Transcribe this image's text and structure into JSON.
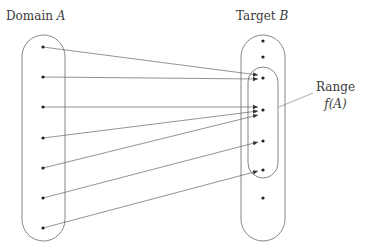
{
  "title_domain": {
    "text": "Domain",
    "var": "A"
  },
  "title_target": {
    "text": "Target",
    "var": "B"
  },
  "range_label": {
    "line1": "Range",
    "line2": "f(A)"
  },
  "colors": {
    "stroke": "#555555",
    "dot": "#222222",
    "background": "#ffffff"
  },
  "domain_points": [
    {
      "id": "a1",
      "x": 43,
      "y": 47
    },
    {
      "id": "a2",
      "x": 43,
      "y": 77
    },
    {
      "id": "a3",
      "x": 43,
      "y": 107
    },
    {
      "id": "a4",
      "x": 43,
      "y": 138
    },
    {
      "id": "a5",
      "x": 43,
      "y": 168
    },
    {
      "id": "a6",
      "x": 43,
      "y": 198
    },
    {
      "id": "a7",
      "x": 43,
      "y": 228
    }
  ],
  "target_points": [
    {
      "id": "b1",
      "x": 263,
      "y": 41,
      "in_range": false
    },
    {
      "id": "b2",
      "x": 263,
      "y": 57,
      "in_range": false
    },
    {
      "id": "b3",
      "x": 263,
      "y": 78,
      "in_range": true
    },
    {
      "id": "b4",
      "x": 263,
      "y": 110,
      "in_range": true
    },
    {
      "id": "b5",
      "x": 263,
      "y": 141,
      "in_range": true
    },
    {
      "id": "b6",
      "x": 263,
      "y": 170,
      "in_range": true
    },
    {
      "id": "b7",
      "x": 263,
      "y": 198,
      "in_range": false
    }
  ],
  "mappings": [
    {
      "from": "a1",
      "to": "b3",
      "ty": 75
    },
    {
      "from": "a2",
      "to": "b3",
      "ty": 79
    },
    {
      "from": "a3",
      "to": "b4",
      "ty": 107
    },
    {
      "from": "a4",
      "to": "b4",
      "ty": 111
    },
    {
      "from": "a5",
      "to": "b4",
      "ty": 115
    },
    {
      "from": "a6",
      "to": "b5",
      "ty": 142
    },
    {
      "from": "a7",
      "to": "b6",
      "ty": 171
    }
  ]
}
